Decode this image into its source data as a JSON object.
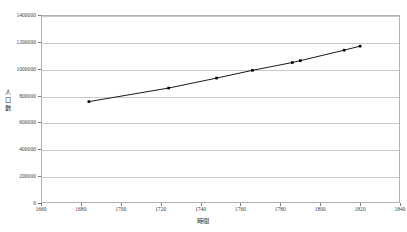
{
  "chart_data": {
    "type": "line",
    "title": "",
    "subtitle": "",
    "xlabel": "時間",
    "ylabel": "人口數",
    "xlim": [
      1660,
      1840
    ],
    "ylim": [
      0,
      1400000
    ],
    "grid": "horizontal",
    "legend": "none",
    "marker": "square",
    "line_color": "#1a1a1a",
    "marker_color": "#000000",
    "grid_color": "#c8c8c8",
    "frame_color": "#b0b0b0",
    "x_ticks": [
      1660,
      1680,
      1700,
      1720,
      1740,
      1760,
      1780,
      1800,
      1820,
      1840
    ],
    "y_ticks": [
      0,
      200000,
      400000,
      600000,
      800000,
      1000000,
      1200000,
      1400000
    ],
    "x_tick_labels": [
      "1660",
      "1680",
      "1700",
      "1720",
      "1740",
      "1760",
      "1780",
      "1800",
      "1820",
      "1840"
    ],
    "y_tick_labels": [
      "0",
      "200000",
      "400000",
      "600000",
      "800000",
      "1000000",
      "1200000",
      "1400000"
    ],
    "series": [
      {
        "name": "人口數",
        "points": [
          {
            "x": 1684,
            "y": 755000
          },
          {
            "x": 1724,
            "y": 856000
          },
          {
            "x": 1748,
            "y": 930000
          },
          {
            "x": 1766,
            "y": 988000
          },
          {
            "x": 1786,
            "y": 1046000
          },
          {
            "x": 1790,
            "y": 1060000
          },
          {
            "x": 1812,
            "y": 1138000
          },
          {
            "x": 1820,
            "y": 1168000
          }
        ]
      }
    ]
  }
}
